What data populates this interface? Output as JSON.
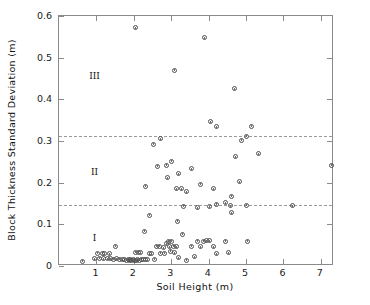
{
  "chart_data": {
    "type": "scatter",
    "title": "",
    "xlabel": "Soil Height (m)",
    "ylabel": "Block Thickness Standard Deviation (m)",
    "xlim": [
      0,
      7.35
    ],
    "ylim": [
      0,
      0.6
    ],
    "xticks": [
      1,
      2,
      3,
      4,
      5,
      6,
      7
    ],
    "xtick_labels": [
      "1",
      "2",
      "3",
      "4",
      "5",
      "6",
      "7"
    ],
    "yticks": [
      0,
      0.1,
      0.2,
      0.3,
      0.4,
      0.5,
      0.6
    ],
    "ytick_labels": [
      "0",
      "0.1",
      "0.2",
      "0.3",
      "0.4",
      "0.5",
      "0.6"
    ],
    "grid": false,
    "legend": "none",
    "marker": "open-circle",
    "annotations": [
      {
        "text": "III",
        "x": 0.95,
        "y": 0.455
      },
      {
        "text": "II",
        "x": 0.95,
        "y": 0.225
      },
      {
        "text": "I",
        "x": 0.95,
        "y": 0.068
      }
    ],
    "reference_lines": [
      {
        "orientation": "horizontal",
        "y": 0.312,
        "style": "dashed"
      },
      {
        "orientation": "horizontal",
        "y": 0.147,
        "style": "dashed"
      }
    ],
    "points": [
      [
        0.62,
        0.012
      ],
      [
        0.95,
        0.018
      ],
      [
        1.02,
        0.031
      ],
      [
        1.08,
        0.019
      ],
      [
        1.15,
        0.031
      ],
      [
        1.18,
        0.017
      ],
      [
        1.22,
        0.03
      ],
      [
        1.3,
        0.018
      ],
      [
        1.35,
        0.03
      ],
      [
        1.38,
        0.017
      ],
      [
        1.45,
        0.016
      ],
      [
        1.52,
        0.047
      ],
      [
        1.55,
        0.017
      ],
      [
        1.62,
        0.016
      ],
      [
        1.7,
        0.015
      ],
      [
        1.75,
        0.016
      ],
      [
        1.8,
        0.014
      ],
      [
        1.85,
        0.015
      ],
      [
        1.88,
        0.014
      ],
      [
        1.92,
        0.015
      ],
      [
        1.95,
        0.014
      ],
      [
        1.98,
        0.015
      ],
      [
        2.02,
        0.014
      ],
      [
        2.06,
        0.014
      ],
      [
        2.1,
        0.015
      ],
      [
        2.15,
        0.014
      ],
      [
        2.2,
        0.016
      ],
      [
        2.25,
        0.015
      ],
      [
        2.3,
        0.016
      ],
      [
        2.36,
        0.015
      ],
      [
        2.05,
        0.033
      ],
      [
        2.12,
        0.033
      ],
      [
        2.18,
        0.032
      ],
      [
        2.42,
        0.03
      ],
      [
        2.48,
        0.03
      ],
      [
        2.55,
        0.016
      ],
      [
        2.6,
        0.047
      ],
      [
        2.68,
        0.048
      ],
      [
        2.72,
        0.031
      ],
      [
        2.78,
        0.044
      ],
      [
        2.82,
        0.031
      ],
      [
        2.88,
        0.054
      ],
      [
        2.92,
        0.06
      ],
      [
        2.95,
        0.046
      ],
      [
        2.98,
        0.035
      ],
      [
        3.02,
        0.06
      ],
      [
        3.06,
        0.048
      ],
      [
        3.1,
        0.032
      ],
      [
        3.15,
        0.046
      ],
      [
        3.2,
        0.02
      ],
      [
        3.3,
        0.076
      ],
      [
        3.42,
        0.014
      ],
      [
        3.55,
        0.047
      ],
      [
        3.62,
        0.022
      ],
      [
        3.7,
        0.06
      ],
      [
        3.78,
        0.046
      ],
      [
        3.85,
        0.06
      ],
      [
        3.95,
        0.061
      ],
      [
        4.02,
        0.061
      ],
      [
        4.12,
        0.046
      ],
      [
        4.2,
        0.03
      ],
      [
        4.45,
        0.059
      ],
      [
        4.52,
        0.032
      ],
      [
        5.05,
        0.059
      ],
      [
        2.28,
        0.084
      ],
      [
        3.18,
        0.108
      ],
      [
        2.42,
        0.122
      ],
      [
        3.32,
        0.144
      ],
      [
        3.7,
        0.14
      ],
      [
        4.02,
        0.142
      ],
      [
        4.22,
        0.148
      ],
      [
        4.45,
        0.152
      ],
      [
        4.58,
        0.145
      ],
      [
        4.62,
        0.128
      ],
      [
        5.02,
        0.146
      ],
      [
        6.25,
        0.145
      ],
      [
        2.3,
        0.192
      ],
      [
        2.9,
        0.212
      ],
      [
        3.15,
        0.185
      ],
      [
        3.28,
        0.186
      ],
      [
        3.4,
        0.178
      ],
      [
        3.78,
        0.196
      ],
      [
        4.12,
        0.186
      ],
      [
        4.6,
        0.168
      ],
      [
        4.82,
        0.202
      ],
      [
        2.62,
        0.24
      ],
      [
        2.88,
        0.242
      ],
      [
        3.2,
        0.222
      ],
      [
        3.02,
        0.252
      ],
      [
        3.55,
        0.234
      ],
      [
        2.52,
        0.292
      ],
      [
        4.72,
        0.262
      ],
      [
        5.32,
        0.27
      ],
      [
        2.72,
        0.305
      ],
      [
        4.88,
        0.302
      ],
      [
        5.02,
        0.312
      ],
      [
        7.28,
        0.242
      ],
      [
        2.05,
        0.572
      ],
      [
        3.88,
        0.548
      ],
      [
        3.1,
        0.47
      ],
      [
        4.7,
        0.425
      ],
      [
        4.05,
        0.346
      ],
      [
        4.22,
        0.334
      ],
      [
        5.15,
        0.336
      ]
    ]
  }
}
